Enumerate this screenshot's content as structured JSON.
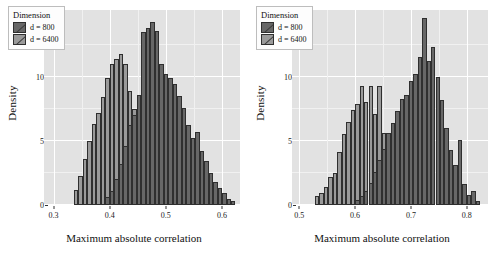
{
  "chart_data": [
    {
      "type": "bar",
      "panel": "left",
      "title": "",
      "xlabel": "Maximum absolute correlation",
      "ylabel": "Density",
      "xlim": [
        0.283,
        0.632
      ],
      "ylim": [
        0,
        15.2
      ],
      "xticks": [
        "0.3",
        "0.4",
        "0.5",
        "0.6"
      ],
      "xtick_values": [
        0.3,
        0.4,
        0.5,
        0.6
      ],
      "yticks": [
        "0",
        "5",
        "10"
      ],
      "ytick_values": [
        0,
        5,
        10
      ],
      "grid": true,
      "legend_position": "top-left",
      "binwidth": 0.008,
      "series": [
        {
          "name": "d = 6400",
          "color": "#9a9a9a",
          "x": [
            0.336,
            0.344,
            0.352,
            0.36,
            0.368,
            0.376,
            0.384,
            0.392,
            0.4,
            0.408,
            0.416,
            0.424,
            0.432,
            0.44,
            0.448,
            0.456,
            0.464,
            0.472
          ],
          "values": [
            1.2,
            2.3,
            3.6,
            5.0,
            6.3,
            7.2,
            8.4,
            9.9,
            11.0,
            11.4,
            11.8,
            11.0,
            8.9,
            7.5,
            4.0,
            2.2,
            1.0,
            0.4
          ]
        },
        {
          "name": "d = 800",
          "color": "#676767",
          "x": [
            0.392,
            0.4,
            0.408,
            0.416,
            0.424,
            0.432,
            0.44,
            0.448,
            0.456,
            0.464,
            0.472,
            0.48,
            0.488,
            0.496,
            0.504,
            0.512,
            0.52,
            0.528,
            0.536,
            0.544,
            0.552,
            0.56,
            0.568,
            0.576,
            0.584,
            0.592,
            0.6,
            0.608,
            0.616
          ],
          "values": [
            0.6,
            1.1,
            2.0,
            3.2,
            4.6,
            6.2,
            7.0,
            8.6,
            13.5,
            13.8,
            14.3,
            13.6,
            11.0,
            10.2,
            9.9,
            9.4,
            8.5,
            7.6,
            6.2,
            5.2,
            5.7,
            4.2,
            3.4,
            2.5,
            1.8,
            1.3,
            0.9,
            0.5,
            0.3
          ]
        }
      ]
    },
    {
      "type": "bar",
      "panel": "right",
      "title": "",
      "xlabel": "Maximum absolute correlation",
      "ylabel": "Density",
      "xlim": [
        0.487,
        0.838
      ],
      "ylim": [
        0,
        15.2
      ],
      "xticks": [
        "0.5",
        "0.6",
        "0.7",
        "0.8"
      ],
      "xtick_values": [
        0.5,
        0.6,
        0.7,
        0.8
      ],
      "yticks": [
        "0",
        "5",
        "10"
      ],
      "ytick_values": [
        0,
        5,
        10
      ],
      "grid": true,
      "legend_position": "top-left",
      "binwidth": 0.008,
      "series": [
        {
          "name": "d = 6400",
          "color": "#9a9a9a",
          "x": [
            0.528,
            0.536,
            0.544,
            0.552,
            0.56,
            0.568,
            0.576,
            0.584,
            0.592,
            0.6,
            0.608,
            0.616,
            0.624,
            0.632,
            0.64,
            0.648,
            0.656,
            0.664,
            0.672,
            0.68
          ],
          "values": [
            0.7,
            0.9,
            1.4,
            2.2,
            2.5,
            4.1,
            5.5,
            6.5,
            7.4,
            7.9,
            9.3,
            8.0,
            9.3,
            7.1,
            9.3,
            5.6,
            3.2,
            2.0,
            1.1,
            0.5
          ]
        },
        {
          "name": "d = 800",
          "color": "#676767",
          "x": [
            0.6,
            0.608,
            0.616,
            0.624,
            0.632,
            0.64,
            0.648,
            0.656,
            0.664,
            0.672,
            0.68,
            0.688,
            0.696,
            0.704,
            0.712,
            0.72,
            0.728,
            0.736,
            0.744,
            0.752,
            0.76,
            0.768,
            0.776,
            0.784,
            0.792,
            0.8,
            0.808,
            0.816
          ],
          "values": [
            0.4,
            0.7,
            1.1,
            1.7,
            2.6,
            3.5,
            4.4,
            5.6,
            6.4,
            7.3,
            8.3,
            8.6,
            9.7,
            10.2,
            11.5,
            14.6,
            11.2,
            12.3,
            10.0,
            8.2,
            6.0,
            4.3,
            3.1,
            5.1,
            1.6,
            0.8,
            1.1,
            0.3
          ]
        }
      ]
    }
  ],
  "legend": {
    "title": "Dimension",
    "items": [
      {
        "label": "d = 800",
        "color": "#676767"
      },
      {
        "label": "d = 6400",
        "color": "#9a9a9a"
      }
    ]
  },
  "colors": {
    "panel_background": "#e2e2e2",
    "gridline": "#ffffff",
    "series_800": "#676767",
    "series_6400": "#9a9a9a",
    "bar_outline": "#2f2f2f"
  }
}
